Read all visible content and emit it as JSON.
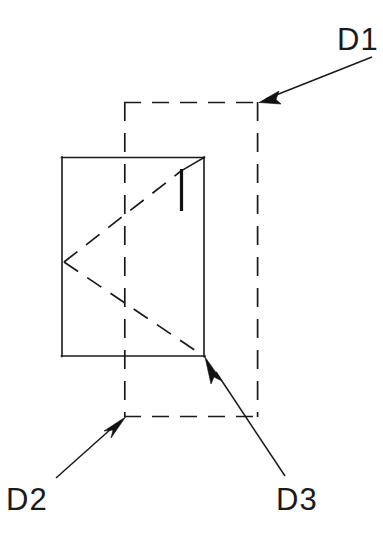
{
  "diagram": {
    "background_color": "#ffffff",
    "line_color": "#1a1a1a",
    "canvas": {
      "width": 383,
      "height": 543
    },
    "callouts": [
      {
        "id": "D1",
        "label": "D1",
        "label_x": 337,
        "label_y": 50,
        "leader_start_x": 372,
        "leader_start_y": 57,
        "leader_end_x": 259,
        "leader_end_y": 102,
        "target": "dashed-outline-top-right-corner"
      },
      {
        "id": "D2",
        "label": "D2",
        "label_x": 6,
        "label_y": 510,
        "leader_start_x": 56,
        "leader_start_y": 478,
        "leader_end_x": 125,
        "leader_end_y": 417,
        "target": "dashed-outline-bottom-left-corner"
      },
      {
        "id": "D3",
        "label": "D3",
        "label_x": 276,
        "label_y": 510,
        "leader_start_x": 285,
        "leader_start_y": 476,
        "leader_end_x": 205,
        "leader_end_y": 357,
        "target": "solid-body-bottom-right-corner"
      }
    ],
    "solid_body": {
      "name": "front-face-rectangle",
      "x": 62,
      "y": 157,
      "width": 142,
      "height": 199
    },
    "hidden_outline": {
      "name": "offset-dashed-rectangle",
      "x": 124,
      "y": 102,
      "width": 134,
      "height": 315
    },
    "internal_features": [
      {
        "name": "upper-diagonal",
        "from": [
          64,
          262
        ],
        "to": [
          181,
          172
        ]
      },
      {
        "name": "lower-diagonal",
        "from": [
          64,
          262
        ],
        "to": [
          205,
          357
        ]
      },
      {
        "name": "corner-chamfer",
        "from": [
          204,
          157
        ],
        "to": [
          181,
          172
        ]
      },
      {
        "name": "vertical-rib",
        "from": [
          181,
          170
        ],
        "to": [
          181,
          211
        ]
      }
    ]
  }
}
